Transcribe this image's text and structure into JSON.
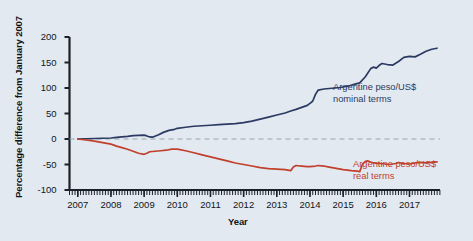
{
  "figure": {
    "background_color": "#e3e9f0",
    "axis_color": "#1b2128",
    "zero_line_color": "#9aa3ad"
  },
  "chart_data": {
    "type": "line",
    "title": "",
    "xlabel": "Year",
    "ylabel": "Percentage difference from January 2007",
    "xlim": [
      2006.75,
      2017.92
    ],
    "ylim": [
      -100,
      200
    ],
    "grid": false,
    "zero_reference_line": 0,
    "legend_position": "inline-annotations",
    "ytick_labels": [
      "200",
      "150",
      "100",
      "50",
      "0",
      "-50",
      "-100"
    ],
    "ytick_values": [
      200,
      150,
      100,
      50,
      0,
      -50,
      -100
    ],
    "xtick_labels": [
      "2007",
      "2008",
      "2009",
      "2010",
      "2011",
      "2012",
      "2013",
      "2014",
      "2015",
      "2016",
      "2017"
    ],
    "xtick_values": [
      2007,
      2008,
      2009,
      2010,
      2011,
      2012,
      2013,
      2014,
      2015,
      2016,
      2017
    ],
    "minor_xticks_per_year": 12,
    "series": [
      {
        "name": "Argentine peso/US$ nominal terms",
        "label_line1": "Argentine peso/US$",
        "label_line2": "nominal terms",
        "color": "#2b3a63",
        "x": [
          2007.0,
          2007.25,
          2007.5,
          2007.75,
          2008.0,
          2008.17,
          2008.33,
          2008.5,
          2008.67,
          2008.83,
          2009.0,
          2009.08,
          2009.17,
          2009.25,
          2009.42,
          2009.58,
          2009.75,
          2009.92,
          2010.0,
          2010.25,
          2010.5,
          2010.75,
          2011.0,
          2011.25,
          2011.5,
          2011.75,
          2012.0,
          2012.25,
          2012.5,
          2012.75,
          2013.0,
          2013.25,
          2013.42,
          2013.58,
          2013.75,
          2013.92,
          2014.0,
          2014.08,
          2014.17,
          2014.25,
          2014.42,
          2014.58,
          2014.75,
          2014.92,
          2015.0,
          2015.17,
          2015.33,
          2015.5,
          2015.67,
          2015.83,
          2015.92,
          2016.0,
          2016.08,
          2016.17,
          2016.33,
          2016.5,
          2016.67,
          2016.83,
          2017.0,
          2017.17,
          2017.33,
          2017.5,
          2017.67,
          2017.83
        ],
        "y": [
          0,
          0.5,
          1,
          1.5,
          2,
          3,
          4,
          5,
          6.5,
          7,
          7.5,
          6,
          4,
          3.5,
          8,
          13,
          17,
          19,
          21,
          23,
          25,
          26,
          27,
          28,
          29,
          30,
          32,
          35,
          39,
          43,
          47,
          51,
          55,
          58,
          62,
          66,
          70,
          74,
          88,
          96,
          98,
          99,
          100,
          101,
          102,
          104,
          107,
          110,
          122,
          138,
          141,
          139,
          144,
          148,
          146,
          145,
          152,
          160,
          162,
          161,
          166,
          172,
          176,
          178
        ]
      },
      {
        "name": "Argentine peso/US$ real terms",
        "label_line1": "Argentine peso/US$",
        "label_line2": "real terms",
        "color": "#c0402c",
        "x": [
          2007.0,
          2007.25,
          2007.5,
          2007.75,
          2008.0,
          2008.17,
          2008.33,
          2008.5,
          2008.67,
          2008.83,
          2009.0,
          2009.08,
          2009.17,
          2009.33,
          2009.5,
          2009.67,
          2009.83,
          2010.0,
          2010.25,
          2010.5,
          2010.75,
          2011.0,
          2011.25,
          2011.5,
          2011.75,
          2012.0,
          2012.25,
          2012.5,
          2012.75,
          2013.0,
          2013.25,
          2013.42,
          2013.5,
          2013.58,
          2013.75,
          2013.92,
          2014.0,
          2014.17,
          2014.25,
          2014.42,
          2014.58,
          2014.75,
          2014.92,
          2015.0,
          2015.25,
          2015.42,
          2015.5,
          2015.58,
          2015.67,
          2015.75,
          2015.83,
          2015.92,
          2016.08,
          2016.25,
          2016.42,
          2016.58,
          2016.67,
          2016.83,
          2017.0,
          2017.17,
          2017.33,
          2017.5,
          2017.67,
          2017.83
        ],
        "y": [
          0,
          -2,
          -4,
          -7,
          -10,
          -14,
          -17,
          -20,
          -24,
          -28,
          -30,
          -28,
          -25,
          -24,
          -23,
          -22,
          -20,
          -20,
          -23,
          -27,
          -31,
          -35,
          -39,
          -43,
          -47,
          -50,
          -53,
          -56,
          -58,
          -59,
          -60,
          -62,
          -55,
          -52,
          -53,
          -54,
          -54,
          -53,
          -52,
          -53,
          -55,
          -57,
          -59,
          -60,
          -62,
          -63,
          -64,
          -50,
          -44,
          -43,
          -45,
          -47,
          -48,
          -49,
          -50,
          -48,
          -46,
          -48,
          -49,
          -47,
          -46,
          -47,
          -46,
          -45
        ]
      }
    ]
  }
}
